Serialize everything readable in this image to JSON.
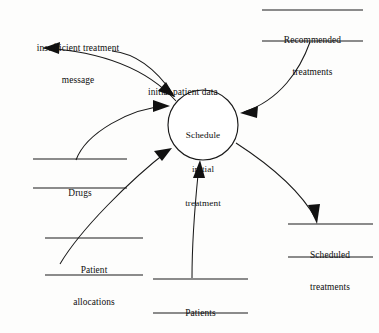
{
  "diagram": {
    "type": "data-flow-diagram",
    "process": {
      "id": "schedule-initial-treatment",
      "label": "Schedule\ninitial\ntreatment",
      "label_lines": [
        "Schedule",
        "initial",
        "treatment"
      ],
      "shape": "circle",
      "center": [
        203,
        125
      ],
      "radius": 35
    },
    "data_stores": [
      {
        "id": "recommended-treatments",
        "label": "Recommended\ntreatments",
        "label_lines": [
          "Recommended",
          "treatments"
        ],
        "position": "top-right"
      },
      {
        "id": "drugs",
        "label": "Drugs",
        "label_lines": [
          "Drugs"
        ],
        "position": "left"
      },
      {
        "id": "patient-allocations",
        "label": "Patient\nallocations",
        "label_lines": [
          "Patient",
          "allocations"
        ],
        "position": "bottom-left"
      },
      {
        "id": "patients",
        "label": "Patients",
        "label_lines": [
          "Patients"
        ],
        "position": "bottom-center"
      },
      {
        "id": "scheduled-treatments",
        "label": "Scheduled\ntreatments",
        "label_lines": [
          "Scheduled",
          "treatments"
        ],
        "position": "bottom-right"
      }
    ],
    "flows": [
      {
        "id": "insufficient-treatment-message",
        "label": "insufficient treatment\nmessage",
        "label_lines": [
          "insufficient treatment",
          "message"
        ],
        "from": "schedule-initial-treatment",
        "to": "external-sink",
        "direction": "out"
      },
      {
        "id": "initial-patient-data",
        "label": "initial patient data",
        "label_lines": [
          "initial patient data"
        ],
        "from": "external-source",
        "to": "schedule-initial-treatment",
        "direction": "in"
      },
      {
        "id": "recommended-treatments-flow",
        "label": "",
        "from": "recommended-treatments",
        "to": "schedule-initial-treatment",
        "direction": "in"
      },
      {
        "id": "drugs-flow",
        "label": "",
        "from": "drugs",
        "to": "schedule-initial-treatment",
        "direction": "in"
      },
      {
        "id": "patient-allocations-flow",
        "label": "",
        "from": "patient-allocations",
        "to": "schedule-initial-treatment",
        "direction": "in"
      },
      {
        "id": "patients-flow",
        "label": "",
        "from": "patients",
        "to": "schedule-initial-treatment",
        "direction": "in"
      },
      {
        "id": "scheduled-treatments-flow",
        "label": "",
        "from": "schedule-initial-treatment",
        "to": "scheduled-treatments",
        "direction": "out"
      }
    ],
    "colors": {
      "ink": "#111111",
      "background": "#fdfdfc"
    }
  }
}
